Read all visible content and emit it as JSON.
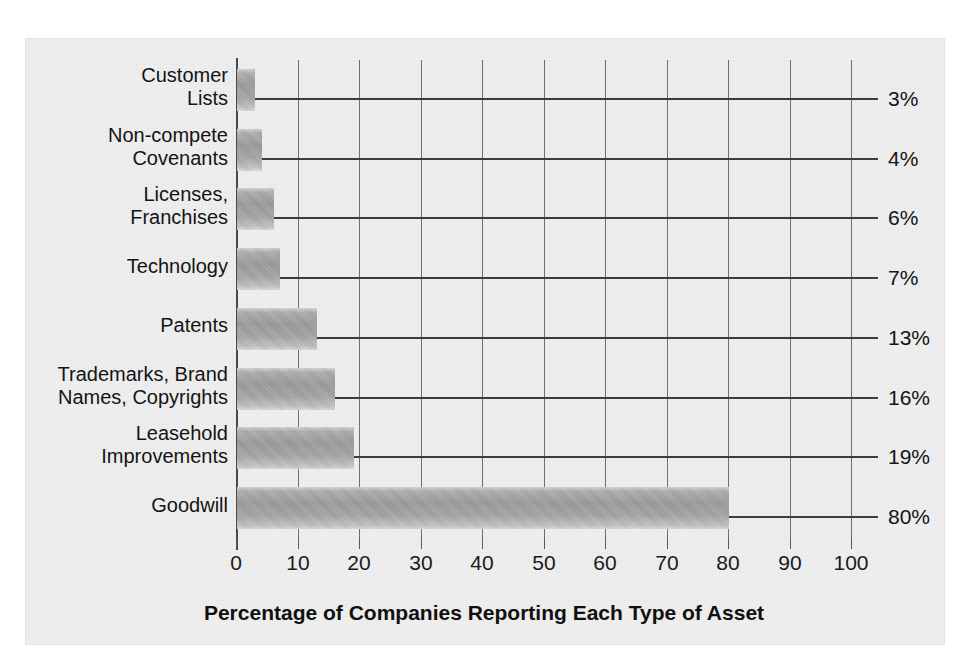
{
  "chart_data": {
    "type": "bar",
    "orientation": "horizontal",
    "title": "",
    "xlabel": "Percentage of Companies Reporting Each Type of Asset",
    "ylabel": "",
    "xlim": [
      0,
      100
    ],
    "xticks": [
      "0",
      "10",
      "20",
      "30",
      "40",
      "50",
      "60",
      "70",
      "80",
      "90",
      "100"
    ],
    "grid": "vertical",
    "legend": "none",
    "categories": [
      "Customer\nLists",
      "Non-compete\nCovenants",
      "Licenses,\nFranchises",
      "Technology",
      "Patents",
      "Trademarks, Brand\nNames, Copyrights",
      "Leasehold\nImprovements",
      "Goodwill"
    ],
    "values": [
      3,
      4,
      6,
      7,
      13,
      16,
      19,
      80
    ],
    "data_labels": [
      "3%",
      "4%",
      "6%",
      "7%",
      "13%",
      "16%",
      "19%",
      "80%"
    ],
    "bar_color": "#9f9f9f",
    "axis_color": "#4a4a4a",
    "grid_color": "#6f6f6f",
    "background_color": "#eeeeee"
  }
}
